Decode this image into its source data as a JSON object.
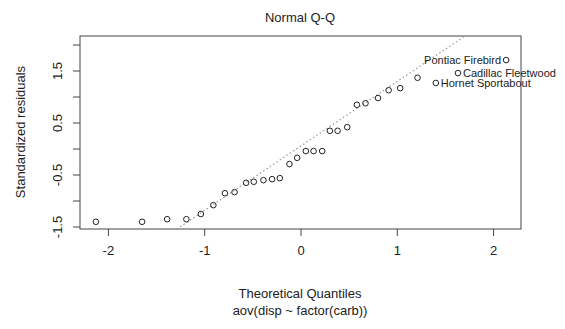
{
  "chart_data": {
    "type": "scatter",
    "title": "Normal Q-Q",
    "xlabel": "Theoretical Quantiles",
    "subtitle": "aov(disp ~ factor(carb))",
    "ylabel": "Standardized residuals",
    "xlim": [
      -2.3,
      2.3
    ],
    "ylim": [
      -1.55,
      2.17
    ],
    "x_ticks": [
      -2,
      -1,
      0,
      1,
      2
    ],
    "x_tick_labels": [
      "-2",
      "-1",
      "0",
      "1",
      "2"
    ],
    "y_ticks": [
      -1.5,
      -1.0,
      -0.5,
      0.0,
      0.5,
      1.0,
      1.5,
      2.0
    ],
    "y_tick_labels": [
      "-1.5",
      "",
      "-0.5",
      "",
      "0.5",
      "",
      "1.5",
      ""
    ],
    "grid": false,
    "legend": null,
    "points": [
      {
        "x": -2.13,
        "y": -1.4
      },
      {
        "x": -1.65,
        "y": -1.4
      },
      {
        "x": -1.39,
        "y": -1.35
      },
      {
        "x": -1.19,
        "y": -1.35
      },
      {
        "x": -1.04,
        "y": -1.25
      },
      {
        "x": -0.91,
        "y": -1.08
      },
      {
        "x": -0.79,
        "y": -0.85
      },
      {
        "x": -0.69,
        "y": -0.83
      },
      {
        "x": -0.57,
        "y": -0.65
      },
      {
        "x": -0.49,
        "y": -0.63
      },
      {
        "x": -0.39,
        "y": -0.6
      },
      {
        "x": -0.3,
        "y": -0.58
      },
      {
        "x": -0.22,
        "y": -0.56
      },
      {
        "x": -0.12,
        "y": -0.29
      },
      {
        "x": -0.04,
        "y": -0.17
      },
      {
        "x": 0.05,
        "y": -0.04
      },
      {
        "x": 0.13,
        "y": -0.04
      },
      {
        "x": 0.22,
        "y": -0.04
      },
      {
        "x": 0.3,
        "y": 0.35
      },
      {
        "x": 0.38,
        "y": 0.35
      },
      {
        "x": 0.48,
        "y": 0.42
      },
      {
        "x": 0.58,
        "y": 0.85
      },
      {
        "x": 0.67,
        "y": 0.88
      },
      {
        "x": 0.8,
        "y": 0.98
      },
      {
        "x": 0.91,
        "y": 1.13
      },
      {
        "x": 1.03,
        "y": 1.17
      },
      {
        "x": 1.21,
        "y": 1.37
      },
      {
        "x": 1.4,
        "y": 1.27,
        "label": "Hornet Sportabout",
        "label_side": "right"
      },
      {
        "x": 1.63,
        "y": 1.46,
        "label": "Cadillac Fleetwood",
        "label_side": "right"
      },
      {
        "x": 2.13,
        "y": 1.71,
        "label": "Pontiac Firebird",
        "label_side": "left"
      }
    ],
    "reference_line": {
      "x1": -1.29,
      "y1": -1.54,
      "x2": 1.7,
      "y2": 2.17,
      "style": "dotted",
      "color": "#999999"
    },
    "colors": {
      "points": "#222222",
      "axis": "#444444",
      "ref_line": "#999999"
    }
  }
}
